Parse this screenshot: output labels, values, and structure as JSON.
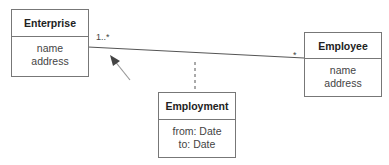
{
  "diagram": {
    "type": "uml-class-diagram",
    "classes": [
      {
        "name": "Enterprise",
        "attributes": [
          "name",
          "address"
        ]
      },
      {
        "name": "Employee",
        "attributes": [
          "name",
          "address"
        ]
      },
      {
        "name": "Employment",
        "attributes": [
          "from: Date",
          "to: Date"
        ]
      }
    ],
    "association": {
      "from": "Enterprise",
      "to": "Employee",
      "multiplicity_from": "1..*",
      "multiplicity_to": "*",
      "association_class": "Employment"
    },
    "colors": {
      "line": "#555555",
      "arrow": "#999999",
      "arrow_head": "#444444"
    }
  }
}
